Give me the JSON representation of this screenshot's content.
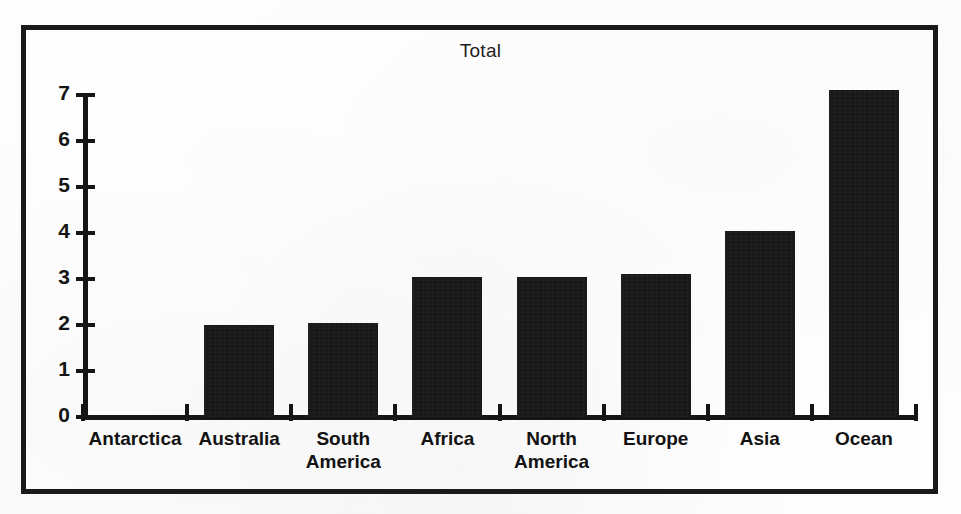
{
  "chart_data": {
    "type": "bar",
    "title": "Total",
    "xlabel": "",
    "ylabel": "",
    "ylim": [
      0,
      7
    ],
    "yticks": [
      0,
      1,
      2,
      3,
      4,
      5,
      6,
      7
    ],
    "ytick_labels": [
      "0",
      "1",
      "2",
      "3",
      "4",
      "5",
      "6",
      "7"
    ],
    "grid": false,
    "legend": null,
    "bar_color": "#161616",
    "background_color": "#fefefe",
    "categories": [
      "Antarctica",
      "South America",
      "Australia",
      "Africa",
      "North America",
      "Europe",
      "Asia",
      "Ocean"
    ],
    "bars": [
      {
        "label": "Antarctica",
        "label_lines": [
          "Antarctica"
        ],
        "value": 0
      },
      {
        "label": "Australia",
        "label_lines": [
          "Australia"
        ],
        "value": 2.0
      },
      {
        "label": "South America",
        "label_lines": [
          "South",
          "America"
        ],
        "value": 2.05
      },
      {
        "label": "Africa",
        "label_lines": [
          "Africa"
        ],
        "value": 3.05
      },
      {
        "label": "North America",
        "label_lines": [
          "North",
          "America"
        ],
        "value": 3.05
      },
      {
        "label": "Europe",
        "label_lines": [
          "Europe"
        ],
        "value": 3.1
      },
      {
        "label": "Asia",
        "label_lines": [
          "Asia"
        ],
        "value": 4.05
      },
      {
        "label": "Ocean",
        "label_lines": [
          "Ocean"
        ],
        "value": 7.1
      }
    ],
    "values": [
      0,
      2.0,
      2.05,
      3.05,
      3.05,
      3.1,
      4.05,
      7.1
    ]
  }
}
